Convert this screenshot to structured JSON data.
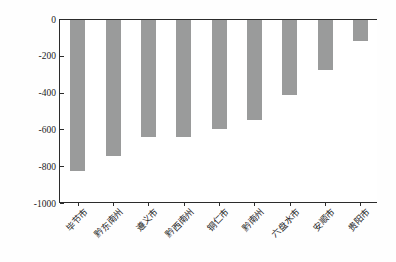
{
  "chart_data": {
    "type": "bar",
    "title": "",
    "subtitle": "",
    "xlabel": "",
    "ylabel": "土壤侵蚀面积变化/km",
    "ylabel_exponent": "2",
    "categories": [
      "毕节市",
      "黔东南州",
      "遵义市",
      "黔西南州",
      "铜仁市",
      "黔南州",
      "六盘水市",
      "安顺市",
      "贵阳市"
    ],
    "values": [
      -825,
      -740,
      -638,
      -638,
      -595,
      -548,
      -408,
      -272,
      -118
    ],
    "ylim": [
      -1000,
      0
    ],
    "ytick_labels": [
      "0",
      "-200",
      "-400",
      "-600",
      "-800",
      "-1000"
    ],
    "ytick_values": [
      0,
      -200,
      -400,
      -600,
      -800,
      -1000
    ],
    "grid": false,
    "legend": false,
    "legend_position": "none",
    "bar_color": "#9a9b9b",
    "axis_color": "#2b2b2b",
    "background_color": "#ffffff",
    "label_rotation_deg": 45
  }
}
